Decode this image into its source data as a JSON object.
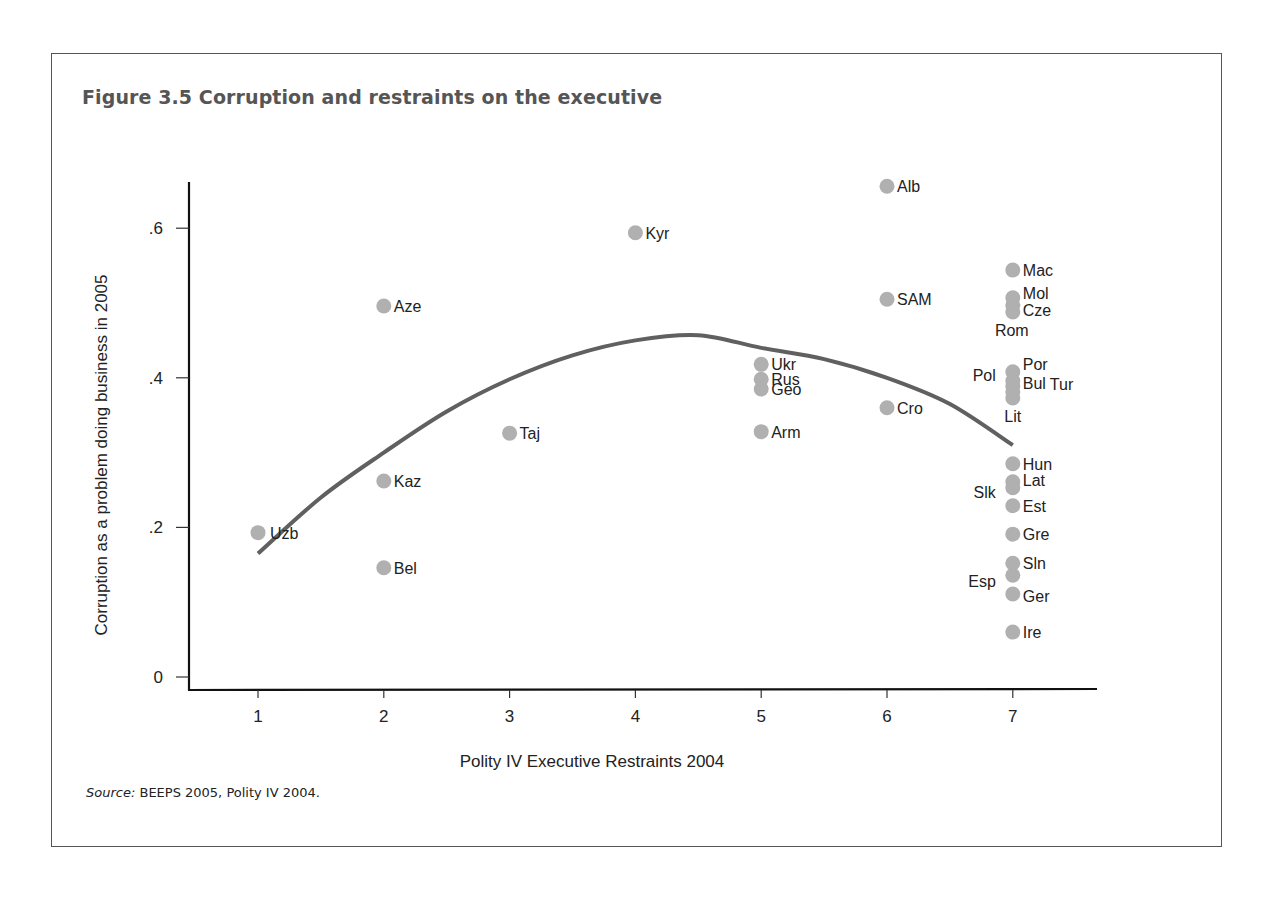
{
  "figure": {
    "title": "Figure 3.5  Corruption and restraints on the executive",
    "source_label": "Source:",
    "source_text": " BEEPS 2005, Polity IV 2004."
  },
  "colors": {
    "frame": "#555555",
    "title": "#555555",
    "dot": "#b0b0b0",
    "curve": "#606060",
    "axis": "#111111"
  },
  "chart_data": {
    "type": "scatter",
    "title": "Corruption and restraints on the executive",
    "xlabel": "Polity IV Executive Restraints 2004",
    "ylabel": "Corruption as a problem doing business in 2005",
    "xlim": [
      0.5,
      7.7
    ],
    "ylim": [
      -0.015,
      0.665
    ],
    "x_ticks": [
      1,
      2,
      3,
      4,
      5,
      6,
      7
    ],
    "x_tick_labels": [
      "1",
      "2",
      "3",
      "4",
      "5",
      "6",
      "7"
    ],
    "y_ticks": [
      0,
      0.2,
      0.4,
      0.6
    ],
    "y_tick_labels": [
      "0",
      ".2",
      ".4",
      ".6"
    ],
    "grid": false,
    "legend": null,
    "points": [
      {
        "label": "Uzb",
        "x": 1,
        "y": 0.193,
        "label_side": "right"
      },
      {
        "label": "Aze",
        "x": 2,
        "y": 0.496,
        "label_side": "right"
      },
      {
        "label": "Kaz",
        "x": 2,
        "y": 0.262,
        "label_side": "right"
      },
      {
        "label": "Bel",
        "x": 2,
        "y": 0.146,
        "label_side": "right"
      },
      {
        "label": "Taj",
        "x": 3,
        "y": 0.326,
        "label_side": "right"
      },
      {
        "label": "Kyr",
        "x": 4,
        "y": 0.594,
        "label_side": "right"
      },
      {
        "label": "Ukr",
        "x": 5,
        "y": 0.418,
        "label_side": "right"
      },
      {
        "label": "Rus",
        "x": 5,
        "y": 0.398,
        "label_side": "right"
      },
      {
        "label": "Geo",
        "x": 5,
        "y": 0.385,
        "label_side": "right"
      },
      {
        "label": "Arm",
        "x": 5,
        "y": 0.328,
        "label_side": "right"
      },
      {
        "label": "Alb",
        "x": 6,
        "y": 0.656,
        "label_side": "right"
      },
      {
        "label": "SAM",
        "x": 6,
        "y": 0.505,
        "label_side": "right"
      },
      {
        "label": "Cro",
        "x": 6,
        "y": 0.36,
        "label_side": "right"
      },
      {
        "label": "Mac",
        "x": 7,
        "y": 0.544,
        "label_side": "right"
      },
      {
        "label": "Mol",
        "x": 7,
        "y": 0.507,
        "label_side": "right"
      },
      {
        "label": "Cze",
        "x": 7,
        "y": 0.497,
        "label_side": "right"
      },
      {
        "label": "Rom",
        "x": 7,
        "y": 0.488,
        "label_side": "below-left"
      },
      {
        "label": "Por",
        "x": 7,
        "y": 0.408,
        "label_side": "right"
      },
      {
        "label": "Pol",
        "x": 7,
        "y": 0.396,
        "label_side": "left"
      },
      {
        "label": "Bul",
        "x": 7,
        "y": 0.389,
        "label_side": "right"
      },
      {
        "label": "Tur",
        "x": 7,
        "y": 0.381,
        "label_side": "right-far"
      },
      {
        "label": "Lit",
        "x": 7,
        "y": 0.373,
        "label_side": "below"
      },
      {
        "label": "Hun",
        "x": 7,
        "y": 0.285,
        "label_side": "right"
      },
      {
        "label": "Lat",
        "x": 7,
        "y": 0.261,
        "label_side": "right"
      },
      {
        "label": "Slk",
        "x": 7,
        "y": 0.253,
        "label_side": "left"
      },
      {
        "label": "Est",
        "x": 7,
        "y": 0.229,
        "label_side": "right"
      },
      {
        "label": "Gre",
        "x": 7,
        "y": 0.191,
        "label_side": "right"
      },
      {
        "label": "Sln",
        "x": 7,
        "y": 0.152,
        "label_side": "right"
      },
      {
        "label": "Esp",
        "x": 7,
        "y": 0.136,
        "label_side": "left"
      },
      {
        "label": "Ger",
        "x": 7,
        "y": 0.111,
        "label_side": "right"
      },
      {
        "label": "Ire",
        "x": 7,
        "y": 0.06,
        "label_side": "right"
      }
    ],
    "fit_curve": {
      "type": "quadratic",
      "x": [
        1,
        1.5,
        2,
        2.5,
        3,
        3.5,
        4,
        4.5,
        5,
        5.5,
        6,
        6.5,
        7
      ],
      "y": [
        0.165,
        0.24,
        0.3,
        0.355,
        0.398,
        0.43,
        0.45,
        0.457,
        0.44,
        0.425,
        0.4,
        0.365,
        0.31
      ]
    }
  }
}
